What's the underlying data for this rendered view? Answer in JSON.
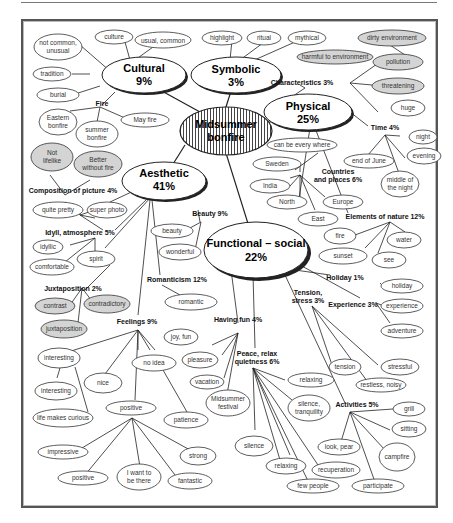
{
  "diagram": {
    "title": "Midsummer bonfire",
    "center": {
      "line1": "Midsummer",
      "line2": "bonfire"
    },
    "categories": [
      {
        "id": "cultural",
        "name": "Cultural",
        "pct": "9%"
      },
      {
        "id": "symbolic",
        "name": "Symbolic",
        "pct": "3%"
      },
      {
        "id": "physical",
        "name": "Physical",
        "pct": "25%"
      },
      {
        "id": "aesthetic",
        "name": "Aesthetic",
        "pct": "41%"
      },
      {
        "id": "functional",
        "name": "Functional – social",
        "pct": "22%"
      }
    ],
    "subgroups": {
      "fire": "Fire",
      "characteristics": "Characteristics 3%",
      "time": "Time 4%",
      "countries": [
        "Countries",
        "and places 6%"
      ],
      "elements": "Elements of nature 12%",
      "composition": "Composition of picture 4%",
      "beauty": "Beauty 9%",
      "idyll": "Idyll, atmosphere 5%",
      "juxtaposition": "Juxtaposition 2%",
      "romanticism": "Romanticism 12%",
      "feelings": "Feelings 9%",
      "holiday": "Holiday 1%",
      "tension": [
        "Tension,",
        "stress 3%"
      ],
      "experience": "Experience 3%",
      "having_fun": "Having fun 4%",
      "peace": [
        "Peace, relax",
        "quietness 6%"
      ],
      "activities": "Activities 5%"
    },
    "leaves": {
      "not_common": [
        "not common,",
        "unusual"
      ],
      "culture": "culture",
      "usual_common": "usual, common",
      "tradition": "tradition",
      "burial": "burial",
      "eastern_bonfire": [
        "Eastern",
        "bonfire"
      ],
      "summer_bonfire": [
        "summer",
        "bonfire"
      ],
      "may_fire": "May fire",
      "highlight": "highlight",
      "ritual": "ritual",
      "mythical": "mythical",
      "dirty_environment": "dirty environment",
      "harmful": "harmful to environment",
      "pollution": "pollution",
      "threatening": "threatening",
      "huge": "huge",
      "night": "night",
      "evening": "evening",
      "end_of_june": "end of June",
      "middle_of_night": [
        "middle of",
        "the night"
      ],
      "can_be_everywhere": "can be every where",
      "sweden": "Sweden",
      "india": "India",
      "north": "North",
      "east": "East",
      "europe": "Europe",
      "fire": "fire",
      "water": "water",
      "sunset": "sunset",
      "see": "see",
      "not_lifelike": [
        "Not",
        "lifelike"
      ],
      "better_without_fire": [
        "Better",
        "without fire"
      ],
      "quite_pretty": "quite pretty",
      "super_photo": "super photo",
      "beauty": "beauty",
      "wonderful": "wonderful",
      "idyllic": "idyllic",
      "comfortable": "comfortable",
      "spirit": "spirit",
      "contrast": "contrast",
      "contradictory": "contradictory",
      "juxtaposition": "juxtaposition",
      "romantic": "romantic",
      "holiday": "holiday",
      "experience": "experience",
      "adventure": "adventure",
      "joy_fun": "joy, fun",
      "pleasure": "pleasure",
      "vacation": "vacation",
      "midsummer_festival": [
        "Midsummer",
        "festival"
      ],
      "tension": "tension",
      "stressful": "stressful",
      "restless_noisy": "restless, noisy",
      "interesting1": "interesting",
      "interesting2": "interesting",
      "life_makes_curious": "life makes curious",
      "nice": "nice",
      "no_idea": "no idea",
      "patience": "patience",
      "positive_group": "positive",
      "impressive": "impressive",
      "positive": "positive",
      "want_to_be_there": [
        "I want to",
        "be there"
      ],
      "fantastic": "fantastic",
      "strong": "strong",
      "relaxing1": "relaxing",
      "silence_tranquility": [
        "silence,",
        "tranquility"
      ],
      "silence": "silence",
      "relaxing2": "relaxing",
      "recuperation": "recuperation",
      "few_people": "few people",
      "grill": "grill",
      "sitting": "sitting",
      "look_pear": "look, pear",
      "campfire": "campfire",
      "participate": "participate"
    },
    "colors": {
      "line": "#222222",
      "shaded": "#d4d4d4",
      "stroke": "#333333",
      "frame": "#555555"
    }
  }
}
